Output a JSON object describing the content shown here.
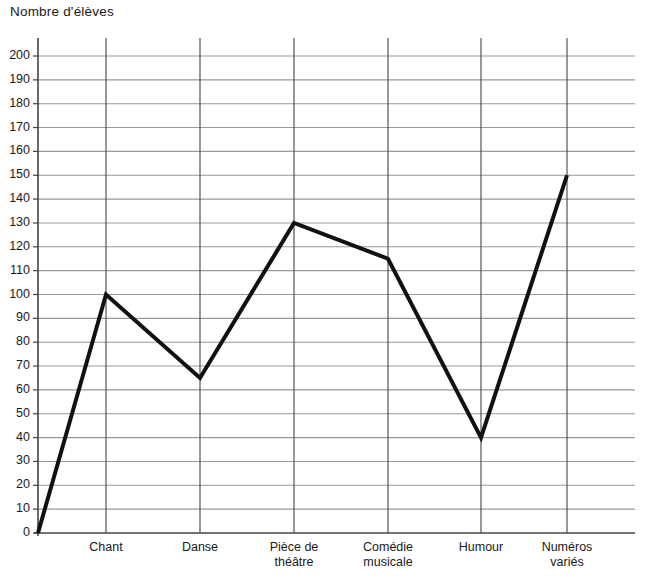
{
  "chart_data": {
    "type": "line",
    "title": "Nombre d'élèves",
    "xlabel": "",
    "ylabel": "Nombre d'élèves",
    "categories": [
      "Chant",
      "Danse",
      "Pièce de théâtre",
      "Comédie musicale",
      "Humour",
      "Numéros variés"
    ],
    "category_lines": [
      [
        "Chant"
      ],
      [
        "Danse"
      ],
      [
        "Pièce de",
        "théâtre"
      ],
      [
        "Comédie",
        "musicale"
      ],
      [
        "Humour"
      ],
      [
        "Numéros",
        "variés"
      ]
    ],
    "values": [
      100,
      65,
      130,
      115,
      40,
      150
    ],
    "origin_value": 0,
    "ylim": [
      0,
      200
    ],
    "ytick_step": 10,
    "ytick_labels": [
      "0",
      "10",
      "20",
      "30",
      "40",
      "50",
      "60",
      "70",
      "80",
      "90",
      "100",
      "110",
      "120",
      "130",
      "140",
      "150",
      "160",
      "170",
      "180",
      "190",
      "200"
    ],
    "grid": true,
    "legend": "none",
    "series_color": "#111111",
    "grid_color": "#999999",
    "axis_color": "#444444"
  }
}
